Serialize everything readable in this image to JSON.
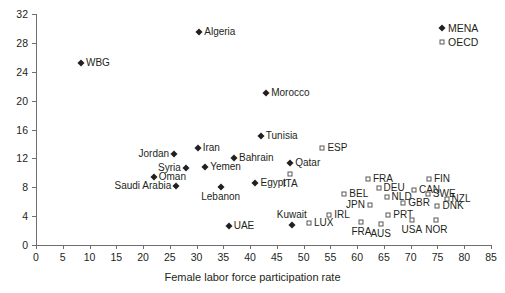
{
  "chart_data": {
    "type": "scatter",
    "title": "",
    "xlabel": "Female labor force participation rate",
    "ylabel": "",
    "xlim": [
      0,
      85
    ],
    "ylim": [
      0,
      32
    ],
    "xticks": [
      0,
      5,
      10,
      15,
      20,
      25,
      30,
      35,
      40,
      45,
      50,
      55,
      60,
      65,
      70,
      75,
      80,
      85
    ],
    "yticks": [
      0,
      4,
      8,
      12,
      16,
      20,
      24,
      28,
      32
    ],
    "grid": false,
    "legend_position": "top-right",
    "legend": [
      {
        "name": "MENA",
        "marker": "filled-diamond",
        "color": "#231f20"
      },
      {
        "name": "OECD",
        "marker": "open-square",
        "color": "#58595b"
      }
    ],
    "series": [
      {
        "name": "MENA",
        "marker": "filled-diamond",
        "points": [
          {
            "label": "WBG",
            "x": 8.4,
            "y": 25.2,
            "label_pos": "right"
          },
          {
            "label": "Algeria",
            "x": 30.5,
            "y": 29.5,
            "label_pos": "right"
          },
          {
            "label": "Morocco",
            "x": 43.0,
            "y": 21.0,
            "label_pos": "right"
          },
          {
            "label": "Tunisia",
            "x": 42.0,
            "y": 15.1,
            "label_pos": "right"
          },
          {
            "label": "Iran",
            "x": 30.2,
            "y": 13.4,
            "label_pos": "right"
          },
          {
            "label": "Jordan",
            "x": 25.8,
            "y": 12.6,
            "label_pos": "left"
          },
          {
            "label": "Bahrain",
            "x": 37.0,
            "y": 12.0,
            "label_pos": "right"
          },
          {
            "label": "Qatar",
            "x": 47.5,
            "y": 11.3,
            "label_pos": "right"
          },
          {
            "label": "Syria",
            "x": 28.0,
            "y": 10.7,
            "label_pos": "left"
          },
          {
            "label": "Yemen",
            "x": 31.6,
            "y": 10.8,
            "label_pos": "right"
          },
          {
            "label": "Oman",
            "x": 22.0,
            "y": 9.4,
            "label_pos": "right"
          },
          {
            "label": "Egypt",
            "x": 41.0,
            "y": 8.6,
            "label_pos": "right"
          },
          {
            "label": "Saudi Arabia",
            "x": 26.2,
            "y": 8.2,
            "label_pos": "left"
          },
          {
            "label": "Lebanon",
            "x": 34.5,
            "y": 8.0,
            "label_pos": "below"
          },
          {
            "label": "Kuwait",
            "x": 47.8,
            "y": 2.8,
            "label_pos": "above"
          },
          {
            "label": "UAE",
            "x": 36.0,
            "y": 2.6,
            "label_pos": "right"
          }
        ]
      },
      {
        "name": "OECD",
        "marker": "open-square",
        "points": [
          {
            "label": "ESP",
            "x": 53.5,
            "y": 13.5,
            "label_pos": "right"
          },
          {
            "label": "ITA",
            "x": 47.5,
            "y": 9.8,
            "label_pos": "below"
          },
          {
            "label": "FRA",
            "x": 62.0,
            "y": 9.2,
            "label_pos": "right"
          },
          {
            "label": "FIN",
            "x": 73.4,
            "y": 9.2,
            "label_pos": "right"
          },
          {
            "label": "DEU",
            "x": 64.0,
            "y": 7.9,
            "label_pos": "right"
          },
          {
            "label": "CAN",
            "x": 70.6,
            "y": 7.6,
            "label_pos": "right"
          },
          {
            "label": "BEL",
            "x": 57.6,
            "y": 7.1,
            "label_pos": "right"
          },
          {
            "label": "SWE",
            "x": 73.2,
            "y": 7.0,
            "label_pos": "right"
          },
          {
            "label": "NLD",
            "x": 65.5,
            "y": 6.6,
            "label_pos": "right"
          },
          {
            "label": "NZL",
            "x": 76.7,
            "y": 6.4,
            "label_pos": "right"
          },
          {
            "label": "GBR",
            "x": 68.6,
            "y": 5.8,
            "label_pos": "right"
          },
          {
            "label": "JPN",
            "x": 62.4,
            "y": 5.5,
            "label_pos": "left"
          },
          {
            "label": "DNK",
            "x": 75.0,
            "y": 5.4,
            "label_pos": "right"
          },
          {
            "label": "IRL",
            "x": 54.8,
            "y": 4.2,
            "label_pos": "right"
          },
          {
            "label": "PRT",
            "x": 65.8,
            "y": 4.2,
            "label_pos": "right"
          },
          {
            "label": "LUX",
            "x": 51.0,
            "y": 3.0,
            "label_pos": "right"
          },
          {
            "label": "USA",
            "x": 70.2,
            "y": 3.4,
            "label_pos": "below"
          },
          {
            "label": "NOR",
            "x": 74.8,
            "y": 3.4,
            "label_pos": "below"
          },
          {
            "label": "FRA",
            "x": 60.8,
            "y": 3.2,
            "label_pos": "below"
          },
          {
            "label": "AUS",
            "x": 64.4,
            "y": 2.9,
            "label_pos": "below"
          }
        ]
      }
    ]
  }
}
